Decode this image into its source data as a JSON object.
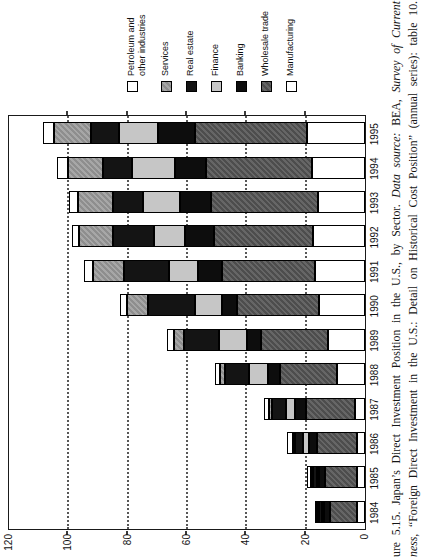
{
  "caption": {
    "line1_text": "ure 5.15. Japan’s Direct Investment Position in the U.S., by Sector. ",
    "line1_datasource": "Data source:",
    "line1_bea": " BEA, ",
    "line1_journal": "Survey of Current",
    "line2_journal": "ness,",
    "line2_text": " “Foreign Direct Investment in the U.S.: Detail on Historical Cost Position” (annual series): table 10."
  },
  "chart_data": {
    "type": "bar",
    "stacked": true,
    "orientation": "vertical bars; whole figure printed rotated 90° counterclockwise",
    "categories": [
      "1984",
      "1985",
      "1986",
      "1987",
      "1988",
      "1989",
      "1990",
      "1991",
      "1992",
      "1993",
      "1994",
      "1995"
    ],
    "series": [
      {
        "key": "manufacturing",
        "name": "Manufacturing",
        "color": "#ffffff",
        "values": [
          2.8,
          2.8,
          2.8,
          3.4,
          9.3,
          12.4,
          15.4,
          16.9,
          17.5,
          15.8,
          18.0,
          19.7
        ]
      },
      {
        "key": "wholesale",
        "name": "Wholesale trade",
        "color": "#565656",
        "values": [
          9.0,
          10.7,
          13.5,
          16.5,
          19.2,
          22.8,
          27.7,
          31.3,
          33.5,
          36.0,
          35.7,
          37.7
        ]
      },
      {
        "key": "banking",
        "name": "Banking",
        "color": "#0d0d0d",
        "values": [
          2.0,
          2.0,
          2.5,
          3.7,
          4.2,
          4.5,
          5.0,
          8.1,
          9.8,
          10.5,
          10.3,
          12.4
        ]
      },
      {
        "key": "finance",
        "name": "Finance",
        "color": "#c6c6c6",
        "values": [
          0.3,
          0.5,
          2.2,
          2.9,
          6.4,
          9.4,
          9.3,
          9.8,
          10.5,
          12.6,
          14.5,
          13.0
        ]
      },
      {
        "key": "real_estate",
        "name": "Real estate",
        "color": "#141414",
        "values": [
          1.2,
          1.5,
          2.6,
          4.7,
          8.2,
          12.0,
          15.6,
          15.0,
          13.5,
          10.1,
          9.7,
          9.5
        ]
      },
      {
        "key": "services",
        "name": "Services",
        "color": "#9a9a9a",
        "values": [
          0.3,
          0.3,
          0.4,
          1.1,
          1.5,
          3.4,
          7.1,
          10.7,
          11.5,
          11.9,
          12.0,
          12.4
        ]
      },
      {
        "key": "petroleum",
        "name": "Petroleum and other industries",
        "color": "#ffffff",
        "values": [
          0.4,
          1.1,
          2.0,
          1.7,
          1.9,
          2.4,
          2.5,
          3.1,
          2.6,
          2.8,
          3.6,
          3.7
        ]
      }
    ],
    "legend_items": [
      {
        "key": "petroleum",
        "label": "Petroleum and other industries"
      },
      {
        "key": "services",
        "label": "Services"
      },
      {
        "key": "real_estate",
        "label": "Real estate"
      },
      {
        "key": "finance",
        "label": "Finance"
      },
      {
        "key": "banking",
        "label": "Banking"
      },
      {
        "key": "wholesale",
        "label": "Wholesale trade"
      },
      {
        "key": "manufacturing",
        "label": "Manufacturing"
      }
    ],
    "legend_position": "right",
    "ylim": [
      0,
      120
    ],
    "yticks": [
      0,
      20,
      40,
      60,
      80,
      100,
      120
    ],
    "grid": "dotted lines at 20, 40, 60, 80, 100"
  }
}
